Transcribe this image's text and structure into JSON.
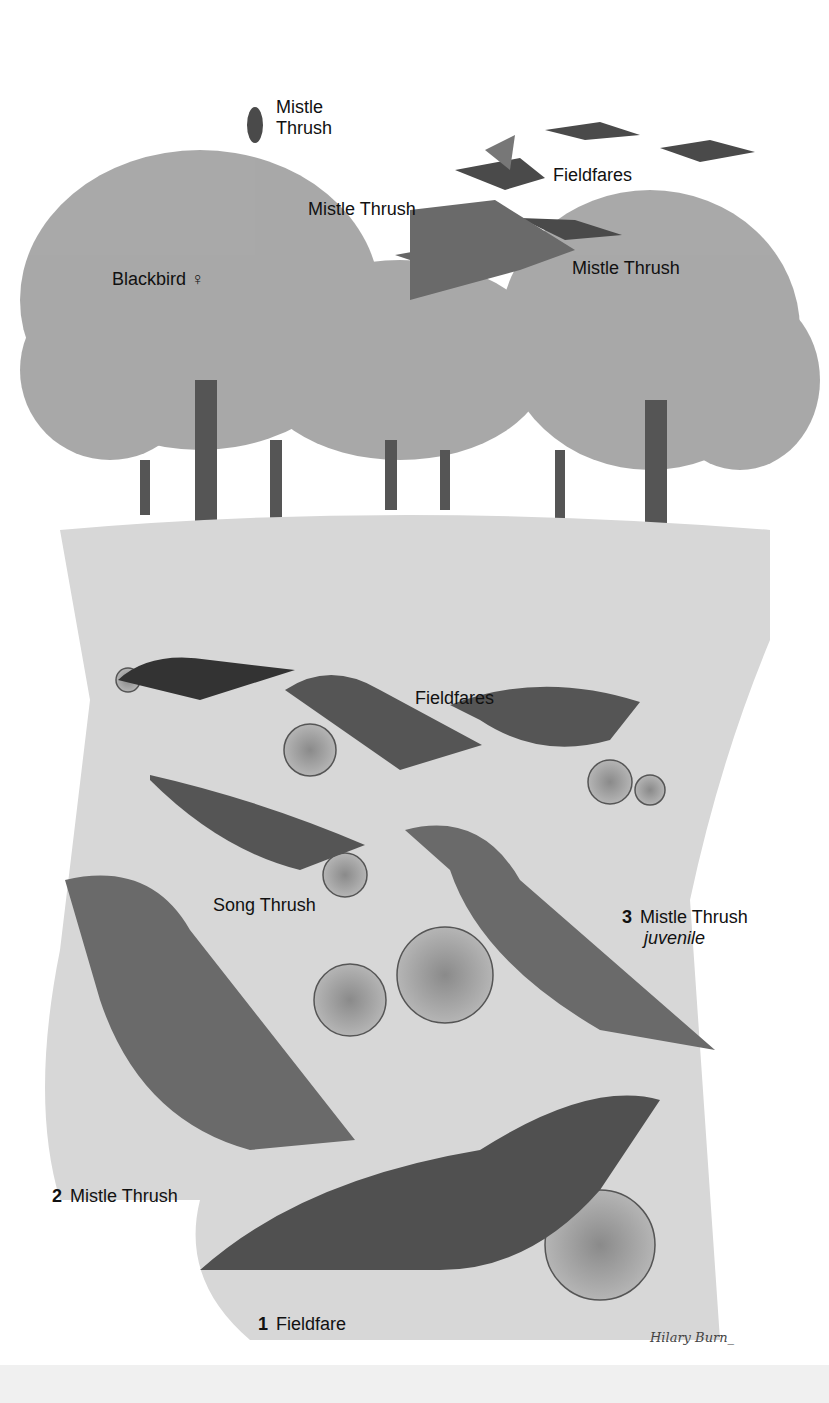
{
  "illustration": {
    "subject": "Thrushes in an orchard",
    "labels": [
      {
        "id": "mistle-thrush-perched",
        "text": "Mistle Thrush",
        "text2": "Thrush",
        "line1": "Mistle"
      },
      {
        "id": "fieldfares-flying",
        "text": "Fieldfares"
      },
      {
        "id": "mistle-thrush-flying-top",
        "text": "Mistle Thrush"
      },
      {
        "id": "mistle-thrush-flying-mid",
        "text": "Mistle Thrush"
      },
      {
        "id": "blackbird-female",
        "text": "Blackbird ♀"
      },
      {
        "id": "fieldfares-ground",
        "text": "Fieldfares"
      },
      {
        "id": "song-thrush",
        "text": "Song Thrush"
      },
      {
        "id": "mistle-thrush-juvenile",
        "number": "3",
        "text": "Mistle Thrush",
        "note": "juvenile"
      },
      {
        "id": "mistle-thrush-2",
        "number": "2",
        "text": "Mistle Thrush"
      },
      {
        "id": "fieldfare-1",
        "number": "1",
        "text": "Fieldfare"
      }
    ],
    "signature": "Hilary Burn_"
  }
}
